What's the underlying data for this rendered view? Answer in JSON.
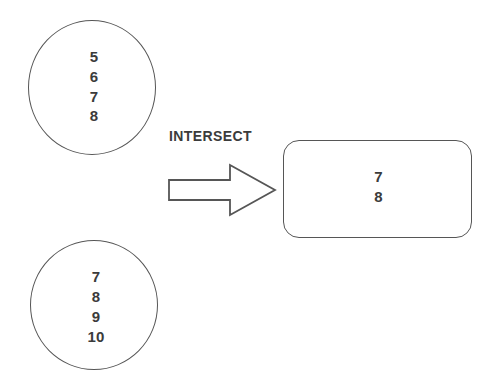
{
  "diagram": {
    "operation_label": "INTERSECT",
    "stroke_color": "#565656",
    "text_color": "#3b3b3b",
    "background_color": "#ffffff",
    "arrow": {
      "icon": "block-arrow-right-icon",
      "direction": "right",
      "style": "hollow-outline"
    },
    "operand_top": {
      "shape": "circle",
      "members": [
        "5",
        "6",
        "7",
        "8"
      ]
    },
    "operand_bottom": {
      "shape": "circle",
      "members": [
        "7",
        "8",
        "9",
        "10"
      ]
    },
    "result": {
      "shape": "rounded-rectangle",
      "members": [
        "7",
        "8"
      ]
    }
  }
}
